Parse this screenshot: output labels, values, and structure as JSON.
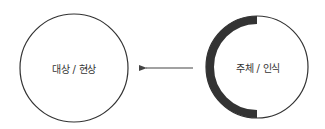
{
  "diagram": {
    "left_node": {
      "label": "대상 / 현상",
      "cx": 74,
      "cy": 68,
      "r": 54
    },
    "right_node": {
      "label": "주체 / 인식",
      "cx": 257,
      "cy": 67,
      "r": 51,
      "emphasis": "thick-left-arc"
    },
    "edge": {
      "from": "right_node",
      "to": "left_node",
      "x1": 193,
      "x2": 140,
      "y": 68
    },
    "colors": {
      "stroke": "#333333",
      "arc": "#333333",
      "text": "#333333",
      "arrow": "#444444"
    }
  }
}
